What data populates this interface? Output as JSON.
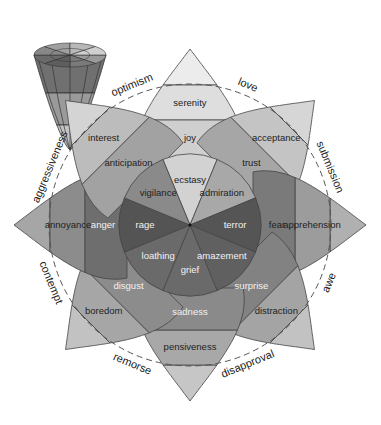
{
  "diagram": {
    "center": [
      190,
      225
    ],
    "radii": {
      "inner": 67,
      "middle": 105,
      "outer": 140,
      "tip": 176,
      "dashed": 141
    },
    "colors": {
      "stroke": "#444444",
      "dashed": "#555555",
      "inner_dark": "#5e5e5e",
      "inner_light": "#c8c8c8",
      "text_light": "#f2f2f2",
      "text_dark": "#222222"
    },
    "petals": [
      {
        "angle": 0,
        "inner": "ecstasy",
        "middle": "joy",
        "outer": "serenity",
        "shades": [
          "#d2d2d2",
          "#cfcfcf",
          "#dedede",
          "#ececec"
        ],
        "light_text": false
      },
      {
        "angle": 45,
        "inner": "admiration",
        "middle": "trust",
        "outer": "acceptance",
        "shades": [
          "#a8a8a8",
          "#a6a6a6",
          "#c4c4c4",
          "#d6d6d6"
        ],
        "light_text": false
      },
      {
        "angle": 90,
        "inner": "terror",
        "middle": "fear",
        "outer": "apprehension",
        "shades": [
          "#555555",
          "#7a7a7a",
          "#9c9c9c",
          "#b0b0b0"
        ],
        "light_text": true
      },
      {
        "angle": 135,
        "inner": "amazement",
        "middle": "surprise",
        "outer": "distraction",
        "shades": [
          "#606060",
          "#828282",
          "#a4a4a4",
          "#c2c2c2"
        ],
        "light_text": true
      },
      {
        "angle": 180,
        "inner": "grief",
        "middle": "sadness",
        "outer": "pensiveness",
        "shades": [
          "#6a6a6a",
          "#8a8a8a",
          "#a8a8a8",
          "#c6c6c6"
        ],
        "light_text": true
      },
      {
        "angle": 225,
        "inner": "loathing",
        "middle": "disgust",
        "outer": "boredom",
        "shades": [
          "#6a6a6a",
          "#8c8c8c",
          "#a6a6a6",
          "#c2c2c2"
        ],
        "light_text": true
      },
      {
        "angle": 270,
        "inner": "rage",
        "middle": "anger",
        "outer": "annoyance",
        "shades": [
          "#545454",
          "#6e6e6e",
          "#8c8c8c",
          "#a6a6a6"
        ],
        "light_text": true
      },
      {
        "angle": 315,
        "inner": "vigilance",
        "middle": "anticipation",
        "outer": "interest",
        "shades": [
          "#8a8a8a",
          "#a2a2a2",
          "#bcbcbc",
          "#d4d4d4"
        ],
        "light_text": false
      }
    ],
    "dyads": [
      {
        "label": "love",
        "angle": 22.5
      },
      {
        "label": "submission",
        "angle": 67.5
      },
      {
        "label": "awe",
        "angle": 112.5
      },
      {
        "label": "disapproval",
        "angle": 157.5
      },
      {
        "label": "remorse",
        "angle": 202.5
      },
      {
        "label": "contempt",
        "angle": 247.5
      },
      {
        "label": "aggressiveness",
        "angle": 292.5
      },
      {
        "label": "optimism",
        "angle": 337.5
      }
    ],
    "cone": {
      "position": [
        70,
        55
      ],
      "rim_colors": [
        "#9a9a9a",
        "#7a7a7a",
        "#5e5e5e",
        "#6a6a6a",
        "#888888",
        "#a0a0a0",
        "#b8b8b8",
        "#cfcfcf"
      ],
      "band_colors": [
        "#707070",
        "#9a9a9a",
        "#c4c4c4"
      ]
    }
  }
}
